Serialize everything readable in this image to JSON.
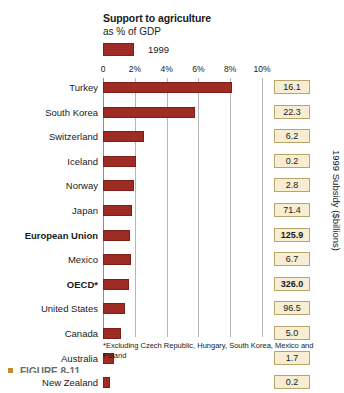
{
  "header": {
    "title": "Support to agriculture",
    "subtitle": "as % of GDP",
    "legend_label": "1999",
    "legend_color": "#9e2b24"
  },
  "side_axis_title": "1999 Subsidy ($billions)",
  "footnote": "*Excluding Czech Republic, Hungary, South Korea, Mexico and Poland",
  "figure_caption": "FIGURE 8-11",
  "chart_data": {
    "type": "bar",
    "orientation": "horizontal",
    "title": "Support to agriculture",
    "subtitle": "as % of GDP",
    "xlabel": "",
    "ylabel": "",
    "xlim": [
      0,
      10
    ],
    "grid": true,
    "legend": [
      "1999"
    ],
    "legend_position": "top-left",
    "xticklabels": [
      "0",
      "2%",
      "4%",
      "6%",
      "8%",
      "10%"
    ],
    "xtickvalues": [
      0,
      2,
      4,
      6,
      8,
      10
    ],
    "series_name": "Support to agriculture as % of GDP, 1999",
    "value_column_header": "1999 Subsidy ($billions)",
    "categories": [
      "Turkey",
      "South Korea",
      "Switzerland",
      "Iceland",
      "Norway",
      "Japan",
      "European Union",
      "Mexico",
      "OECD*",
      "United States",
      "Canada",
      "Australia",
      "New Zealand"
    ],
    "values": [
      8.1,
      5.8,
      2.6,
      2.1,
      1.95,
      1.8,
      1.7,
      1.75,
      1.65,
      1.4,
      1.15,
      0.7,
      0.45
    ],
    "subsidy_billions": [
      16.1,
      22.3,
      6.2,
      0.2,
      2.8,
      71.4,
      125.9,
      6.7,
      326.0,
      96.5,
      5.0,
      1.7,
      0.2
    ],
    "bold_categories": [
      "European Union",
      "OECD*"
    ]
  },
  "rows": [
    {
      "label": "Turkey",
      "pct": 8.1,
      "subsidy": "16.1",
      "bold": false
    },
    {
      "label": "South Korea",
      "pct": 5.8,
      "subsidy": "22.3",
      "bold": false
    },
    {
      "label": "Switzerland",
      "pct": 2.6,
      "subsidy": "6.2",
      "bold": false
    },
    {
      "label": "Iceland",
      "pct": 2.1,
      "subsidy": "0.2",
      "bold": false
    },
    {
      "label": "Norway",
      "pct": 1.95,
      "subsidy": "2.8",
      "bold": false
    },
    {
      "label": "Japan",
      "pct": 1.8,
      "subsidy": "71.4",
      "bold": false
    },
    {
      "label": "European Union",
      "pct": 1.7,
      "subsidy": "125.9",
      "bold": true
    },
    {
      "label": "Mexico",
      "pct": 1.75,
      "subsidy": "6.7",
      "bold": false
    },
    {
      "label": "OECD*",
      "pct": 1.65,
      "subsidy": "326.0",
      "bold": true
    },
    {
      "label": "United States",
      "pct": 1.4,
      "subsidy": "96.5",
      "bold": false
    },
    {
      "label": "Canada",
      "pct": 1.15,
      "subsidy": "5.0",
      "bold": false
    },
    {
      "label": "Australia",
      "pct": 0.7,
      "subsidy": "1.7",
      "bold": false
    },
    {
      "label": "New Zealand",
      "pct": 0.45,
      "subsidy": "0.2",
      "bold": false
    }
  ],
  "axis": {
    "ticks": [
      "0",
      "2%",
      "4%",
      "6%",
      "8%",
      "10%"
    ]
  }
}
